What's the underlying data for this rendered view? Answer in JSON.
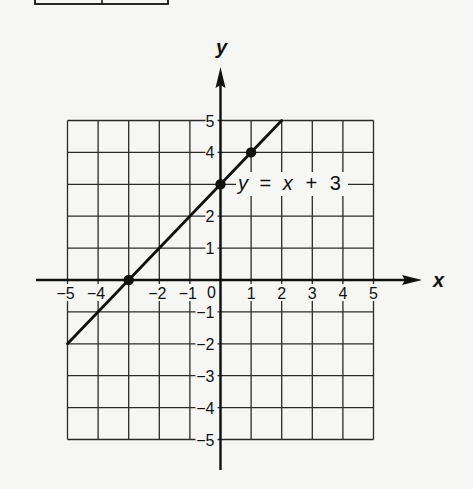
{
  "chart_data": {
    "type": "line",
    "title": "",
    "xlabel": "x",
    "ylabel": "y",
    "xlim": [
      -5,
      5
    ],
    "ylim": [
      -5,
      5
    ],
    "grid": true,
    "x_ticks": [
      "-5",
      "-4",
      "-2",
      "-1",
      "0",
      "1",
      "2",
      "3",
      "4",
      "5"
    ],
    "y_ticks": [
      "5",
      "4",
      "2",
      "1",
      "-1",
      "-2",
      "-3",
      "-4",
      "-5"
    ],
    "series": [
      {
        "name": "y = x + 3",
        "equation": "y = x + 3",
        "segment": [
          [
            -5,
            -2
          ],
          [
            2,
            5
          ]
        ],
        "x": [
          -5,
          -3,
          0,
          1,
          2
        ],
        "y": [
          -2,
          0,
          3,
          4,
          5
        ]
      }
    ],
    "marked_points": [
      {
        "x": -3,
        "y": 0
      },
      {
        "x": 0,
        "y": 3
      },
      {
        "x": 1,
        "y": 4
      }
    ],
    "annotations": [
      {
        "text": "y = x + 3",
        "at": [
          0,
          3
        ]
      }
    ]
  },
  "labels": {
    "x_axis": "x",
    "y_axis": "y",
    "equation": {
      "y": "y",
      "eq": "=",
      "x": "x",
      "plus": "+",
      "c": "3"
    },
    "x_ticks": [
      {
        "v": -5,
        "t": "−5"
      },
      {
        "v": -4,
        "t": "−4"
      },
      {
        "v": -2,
        "t": "−2"
      },
      {
        "v": -1,
        "t": "−1"
      },
      {
        "v": 1,
        "t": "1"
      },
      {
        "v": 2,
        "t": "2"
      },
      {
        "v": 3,
        "t": "3"
      },
      {
        "v": 4,
        "t": "4"
      },
      {
        "v": 5,
        "t": "5"
      }
    ],
    "origin": "0",
    "y_ticks": [
      {
        "v": 5,
        "t": "5"
      },
      {
        "v": 4,
        "t": "4"
      },
      {
        "v": 2,
        "t": "2"
      },
      {
        "v": 1,
        "t": "1"
      },
      {
        "v": -1,
        "t": "−1"
      },
      {
        "v": -2,
        "t": "−2"
      },
      {
        "v": -3,
        "t": "−3"
      },
      {
        "v": -4,
        "t": "−4"
      },
      {
        "v": -5,
        "t": "−5"
      }
    ]
  },
  "colors": {
    "ink": "#111111",
    "grid": "#2a2a2a",
    "paper": "#f6f6f4",
    "label_bg": "#f6f6f4"
  }
}
